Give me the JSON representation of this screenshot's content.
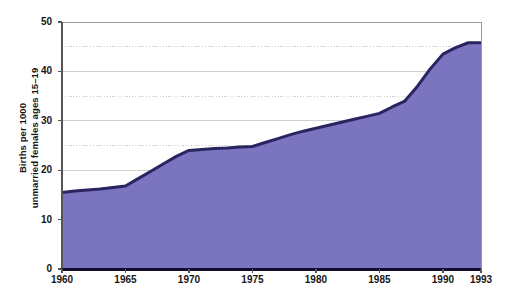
{
  "chart_data": {
    "type": "area",
    "title": "",
    "subtitle": "",
    "xlabel": "",
    "ylabel_line1": "Births per 1000",
    "ylabel_line2": "unmarried females ages 15–19",
    "ylabel": "Births per 1000 unmarried females ages 15–19",
    "x": [
      1960,
      1961,
      1962,
      1963,
      1964,
      1965,
      1966,
      1967,
      1968,
      1969,
      1970,
      1971,
      1972,
      1973,
      1974,
      1975,
      1976,
      1977,
      1978,
      1979,
      1980,
      1981,
      1982,
      1983,
      1984,
      1985,
      1986,
      1987,
      1988,
      1989,
      1990,
      1991,
      1992,
      1993
    ],
    "values": [
      15.5,
      15.8,
      16.0,
      16.2,
      16.5,
      16.8,
      18.3,
      19.8,
      21.3,
      22.8,
      24.0,
      24.2,
      24.4,
      24.5,
      24.7,
      24.8,
      25.6,
      26.4,
      27.2,
      27.9,
      28.5,
      29.1,
      29.7,
      30.3,
      30.9,
      31.5,
      32.8,
      34.0,
      37.0,
      40.5,
      43.5,
      44.8,
      45.8,
      45.8
    ],
    "xlim": [
      1960,
      1993
    ],
    "ylim": [
      0,
      50
    ],
    "x_tick_labels": [
      "1960",
      "1965",
      "1970",
      "1975",
      "1980",
      "1985",
      "1990",
      "1993"
    ],
    "x_tick_values": [
      1960,
      1965,
      1970,
      1975,
      1980,
      1985,
      1990,
      1993
    ],
    "y_tick_labels": [
      "0",
      "10",
      "20",
      "30",
      "40",
      "50"
    ],
    "y_tick_values": [
      0,
      10,
      20,
      30,
      40,
      50
    ],
    "y_gridline_values_solid": [
      10,
      20,
      30,
      40
    ],
    "y_gridline_values_dotted": [
      5,
      15,
      25,
      35,
      45
    ],
    "grid": true,
    "legend": "none",
    "colors": {
      "area_fill": "#7B74BE",
      "area_line": "#2A2560",
      "axis": "#555555",
      "gridline": "#CFCFCF",
      "text": "#161616",
      "background": "#FFFFFF"
    }
  }
}
